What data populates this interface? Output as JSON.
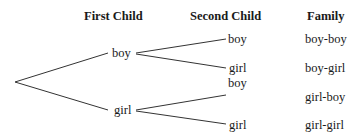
{
  "headers": {
    "first_child": "First Child",
    "second_child": "Second Child",
    "family": "Family"
  },
  "first_level": [
    {
      "label": "boy"
    },
    {
      "label": "girl"
    }
  ],
  "second_level": [
    {
      "label": "boy",
      "family": "boy-boy"
    },
    {
      "label": "girl",
      "family": "boy-girl"
    },
    {
      "label": "boy",
      "family": "girl-boy"
    },
    {
      "label": "girl",
      "family": "girl-girl"
    }
  ],
  "colors": {
    "line": "#333333",
    "text": "#1a1a1a",
    "background": "#ffffff"
  }
}
